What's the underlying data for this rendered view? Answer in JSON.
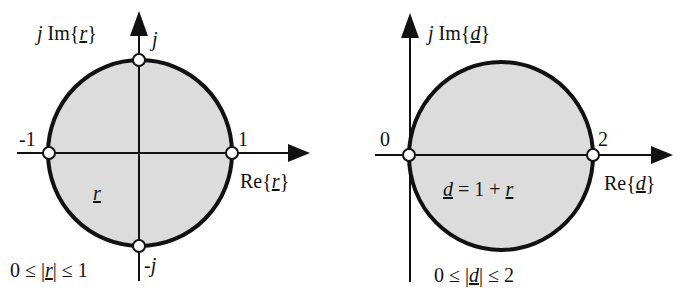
{
  "colors": {
    "fill": "#dcdcdc",
    "stroke": "#111111",
    "marker_fill": "#ffffff"
  },
  "left": {
    "y_axis_label": {
      "prefix": "j",
      "func": " Im{",
      "var": "r",
      "suffix": "}"
    },
    "x_axis_label": {
      "func": "Re{",
      "var": "r",
      "suffix": "}"
    },
    "top_point": "j",
    "bottom_point": "-j",
    "left_point": "-1",
    "right_point": "1",
    "region_label": "r",
    "constraint": {
      "pre": "0 ≤ |",
      "var": "r",
      "post": "| ≤ 1"
    }
  },
  "right": {
    "y_axis_label": {
      "prefix": "j",
      "func": " Im{",
      "var": "d",
      "suffix": "}"
    },
    "x_axis_label": {
      "func": "Re{",
      "var": "d",
      "suffix": "}"
    },
    "left_point": "0",
    "right_point": "2",
    "region_label": {
      "var": "d",
      "mid": " = 1 + ",
      "var2": "r"
    },
    "constraint": {
      "pre": "0 ≤ |",
      "var": "d",
      "post": "| ≤ 2"
    }
  }
}
